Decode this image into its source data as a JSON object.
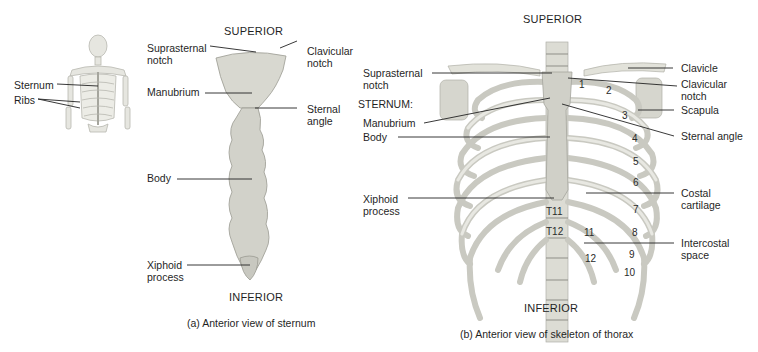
{
  "figure": {
    "panel_a": {
      "caption": "(a) Anterior view of sternum",
      "orientation_top": "SUPERIOR",
      "orientation_bottom": "INFERIOR",
      "thumbnail_labels": [
        "Sternum",
        "Ribs"
      ],
      "labels": {
        "suprasternal_notch": "Suprasternal\nnotch",
        "clavicular_notch": "Clavicular\nnotch",
        "manubrium": "Manubrium",
        "sternal_angle": "Sternal\nangle",
        "body": "Body",
        "xiphoid_process": "Xiphoid\nprocess"
      }
    },
    "panel_b": {
      "caption": "(b) Anterior view of skeleton of thorax",
      "orientation_top": "SUPERIOR",
      "orientation_bottom": "INFERIOR",
      "labels_left": {
        "suprasternal_notch": "Suprasternal\nnotch",
        "sternum_heading": "STERNUM:",
        "manubrium": "Manubrium",
        "body": "Body",
        "xiphoid_process": "Xiphoid\nprocess"
      },
      "labels_right": {
        "clavicle": "Clavicle",
        "clavicular_notch": "Clavicular\nnotch",
        "scapula": "Scapula",
        "sternal_angle": "Sternal angle",
        "costal_cartilage": "Costal\ncartilage",
        "intercostal_space": "Intercostal\nspace"
      },
      "rib_numbers": [
        "1",
        "2",
        "3",
        "4",
        "5",
        "6",
        "7",
        "8",
        "9",
        "10",
        "11",
        "12"
      ],
      "vertebra_labels": [
        "T11",
        "T12"
      ]
    },
    "colors": {
      "bone": "#e3e3dc",
      "bone_shadow": "#b9b9b0",
      "sternum": "#d4d4cc",
      "leader_line": "#222222",
      "text": "#1f1f1f"
    }
  }
}
